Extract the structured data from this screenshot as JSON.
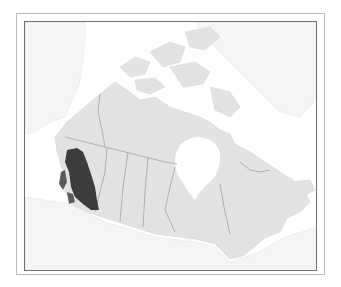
{
  "map": {
    "title": "",
    "type": "species-range-map",
    "region": "Canada",
    "colors": {
      "background": "#ffffff",
      "land_canada": "#e3e3e3",
      "land_other": "#f7f7f7",
      "water": "#ffffff",
      "boundaries": "#8c8c8c",
      "range_fill": "#3c3c3c",
      "outer_frame": "#b9b9b9",
      "inner_frame": "#6f6f6f"
    },
    "legend": [],
    "highlighted_range": {
      "label": "",
      "location": "southern British Columbia"
    }
  }
}
